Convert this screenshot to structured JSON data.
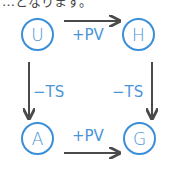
{
  "header_fragment": "…となります。",
  "diagram": {
    "nodes": [
      {
        "id": "U",
        "label": "U",
        "cx": 37,
        "cy": 34
      },
      {
        "id": "H",
        "label": "H",
        "cx": 138,
        "cy": 34
      },
      {
        "id": "A",
        "label": "A",
        "cx": 37,
        "cy": 138
      },
      {
        "id": "G",
        "label": "G",
        "cx": 139,
        "cy": 138
      }
    ],
    "edges": [
      {
        "from": "U",
        "to": "H",
        "label": "+PV"
      },
      {
        "from": "A",
        "to": "G",
        "label": "+PV"
      },
      {
        "from": "U",
        "to": "A",
        "label": "−TS"
      },
      {
        "from": "H",
        "to": "G",
        "label": "−TS"
      }
    ]
  },
  "colors": {
    "node": "#3a8fd8",
    "text": "#4a95d8",
    "arrow": "#4a4a4a"
  }
}
